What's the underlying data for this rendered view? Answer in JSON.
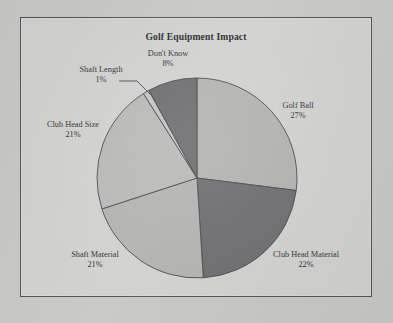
{
  "chart_data": {
    "type": "pie",
    "title": "Golf Equipment Impact",
    "xlabel": "",
    "ylabel": "",
    "legend_position": "none",
    "grid": false,
    "labels": [
      "Golf Ball",
      "Club Head Material",
      "Shaft Material",
      "Club Head Size",
      "Shaft Length",
      "Don't Know"
    ],
    "values": [
      27,
      22,
      21,
      21,
      1,
      8
    ],
    "value_suffix": "%",
    "slices": [
      {
        "label": "Golf Ball",
        "value": 27,
        "value_text": "27%",
        "color": "#b3b3b1"
      },
      {
        "label": "Club Head Material",
        "value": 22,
        "value_text": "22%",
        "color": "#6e6e71"
      },
      {
        "label": "Shaft Material",
        "value": 21,
        "value_text": "21%",
        "color": "#b3b3b1"
      },
      {
        "label": "Club Head Size",
        "value": 21,
        "value_text": "21%",
        "color": "#b9b9b7"
      },
      {
        "label": "Shaft Length",
        "value": 1,
        "value_text": "1%",
        "color": "#c4c4c2"
      },
      {
        "label": "Don't Know",
        "value": 8,
        "value_text": "8%",
        "color": "#6e6e71"
      }
    ],
    "colors": {
      "light_slice": "#b3b3b1",
      "dark_slice": "#6e6e71",
      "slice_outline": "#4a4a4f",
      "plot_background": "#d2d2d0",
      "frame_border": "#55555a",
      "page_background": "#c9c9c7",
      "text": "#35353a"
    }
  },
  "frame": {
    "border_color": "#55555a"
  },
  "labels": {
    "golf_ball": {
      "name": "Golf Ball",
      "value": "27%"
    },
    "club_head_material": {
      "name": "Club Head Material",
      "value": "22%"
    },
    "shaft_material": {
      "name": "Shaft Material",
      "value": "21%"
    },
    "club_head_size": {
      "name": "Club Head Size",
      "value": "21%"
    },
    "shaft_length": {
      "name": "Shaft Length",
      "value": "1%"
    },
    "dont_know": {
      "name": "Don't Know",
      "value": "8%"
    }
  }
}
